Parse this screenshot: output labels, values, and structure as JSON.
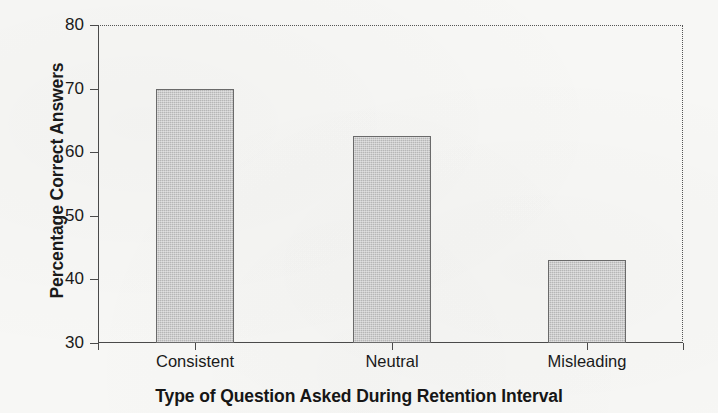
{
  "chart_data": {
    "type": "bar",
    "title": "",
    "categories": [
      "Consistent",
      "Neutral",
      "Misleading"
    ],
    "values": [
      70,
      62.5,
      43
    ],
    "series": [
      {
        "name": "Percentage Correct Answers",
        "values": [
          70,
          62.5,
          43
        ]
      }
    ],
    "xlabel": "Type of Question Asked During Retention Interval",
    "ylabel": "Percentage Correct Answers",
    "ylim": [
      30,
      80
    ],
    "yticks": [
      30,
      40,
      50,
      60,
      70,
      80
    ],
    "ytick_labels": [
      "30",
      "40",
      "50",
      "60",
      "70",
      "80"
    ],
    "grid": false,
    "legend": "none",
    "bar_fill_color": "#b6b6b6",
    "bar_border_color": "#6a6a6a",
    "axis_color": "#4a4a4a",
    "frame_style": "dotted top and right border"
  },
  "axes": {
    "y_title": "Percentage Correct Answers",
    "x_title": "Type of Question Asked During Retention Interval",
    "y_ticks": [
      {
        "label": "80",
        "value": 80
      },
      {
        "label": "70",
        "value": 70
      },
      {
        "label": "60",
        "value": 60
      },
      {
        "label": "50",
        "value": 50
      },
      {
        "label": "40",
        "value": 40
      },
      {
        "label": "30",
        "value": 30
      }
    ],
    "x_categories": [
      {
        "label": "Consistent",
        "value": 70
      },
      {
        "label": "Neutral",
        "value": 62.5
      },
      {
        "label": "Misleading",
        "value": 43
      }
    ]
  }
}
